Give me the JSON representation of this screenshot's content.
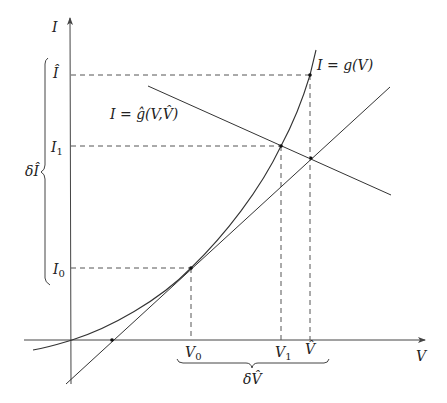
{
  "diagram": {
    "type": "Newton-Raphson style I-V curve diagram",
    "axes": {
      "x_label": "V",
      "y_label": "I",
      "origin": [
        72,
        340
      ]
    },
    "curves": [
      {
        "name": "g",
        "label": "I = g(V)",
        "kind": "exponential-like curve"
      },
      {
        "name": "tangent",
        "kind": "tangent line at (V0, I0)"
      },
      {
        "name": "g_hat",
        "label": "I = ĝ(V,V̂)",
        "kind": "load line"
      }
    ],
    "labels": {
      "curve_g": "I = g(V)",
      "curve_g_hat": "I = ĝ(V,V̂)",
      "y_axis": "I",
      "x_axis": "V",
      "I_hat": "Î",
      "I1": "I",
      "I1_sub": "1",
      "I0": "I",
      "I0_sub": "0",
      "V0": "V",
      "V0_sub": "0",
      "V1": "V",
      "V1_sub": "1",
      "V_hat": "V̂",
      "delta_I": "δÎ",
      "delta_V": "δV̂"
    },
    "points": {
      "V0_I0": [
        191,
        268
      ],
      "V1_I1": [
        281,
        146
      ],
      "Vhat_Ihat": [
        310,
        75
      ],
      "tangent_x_intercept": [
        112,
        340
      ],
      "tangent_ghat_intersection": [
        311,
        158
      ]
    },
    "colors": {
      "stroke": "#333333",
      "dashed": "#555555",
      "background": "#ffffff"
    }
  }
}
